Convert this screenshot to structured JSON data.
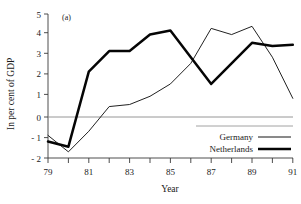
{
  "chart_data": {
    "type": "line",
    "title": "",
    "panel_label": "(a)",
    "xlabel": "Year",
    "ylabel": "In per cent of GDP",
    "xlim": [
      79,
      91
    ],
    "ylim": [
      -2,
      5
    ],
    "xticks": [
      79,
      80,
      81,
      82,
      83,
      84,
      85,
      86,
      87,
      88,
      89,
      90,
      91
    ],
    "xtick_labels": [
      "79",
      "",
      "81",
      "",
      "83",
      "",
      "85",
      "",
      "87",
      "",
      "89",
      "",
      "91"
    ],
    "yticks": [
      -2,
      -1,
      0,
      1,
      2,
      3,
      4,
      5
    ],
    "ytick_labels": [
      "- 2",
      "- 1",
      "0",
      "1",
      "2",
      "3",
      "4",
      "5"
    ],
    "grid": false,
    "zero_line": true,
    "legend_position": "bottom-right",
    "x": [
      79,
      80,
      81,
      82,
      83,
      84,
      85,
      86,
      87,
      88,
      89,
      90,
      91
    ],
    "series": [
      {
        "name": "Germany",
        "style": "thin",
        "color": "#151515",
        "values": [
          -0.9,
          -1.7,
          -0.7,
          0.5,
          0.6,
          1.0,
          1.6,
          2.6,
          4.3,
          4.0,
          4.4,
          2.9,
          0.9
        ]
      },
      {
        "name": "Netherlands",
        "style": "thick",
        "color": "#050505",
        "values": [
          -1.2,
          -1.45,
          2.2,
          3.2,
          3.2,
          4.0,
          4.2,
          2.9,
          1.6,
          2.6,
          3.6,
          3.45,
          3.5
        ]
      }
    ]
  },
  "legend": {
    "entries": [
      {
        "label": "Germany"
      },
      {
        "label": "Netherlands"
      }
    ]
  },
  "axes": {
    "y_title": "In per cent of GDP",
    "x_title": "Year",
    "panel_label": "(a)"
  }
}
